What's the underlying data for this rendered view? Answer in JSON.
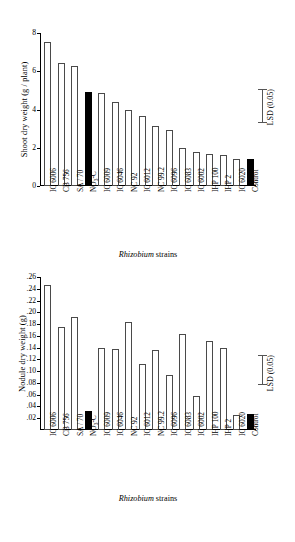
{
  "figure": {
    "xlabel_prefix": "Rhizobium",
    "xlabel_suffix": " strains",
    "categories": [
      "IC 6006",
      "CB 756",
      "SA / 70",
      "NO3-C",
      "IC 6009",
      "IC 6046",
      "NC 92",
      "IC 6012",
      "NC 99.2",
      "IC 6096",
      "IC 6083",
      "IC 6002",
      "IHP 100",
      "IHP 2",
      "IC 6020",
      "Control"
    ],
    "category_labels": [
      {
        "text": "IC 6006",
        "sub": null
      },
      {
        "text": "CB 756",
        "sub": null
      },
      {
        "text": "SA / 70",
        "sub": null
      },
      {
        "text": "NO",
        "sub": "3",
        "tail": "-C"
      },
      {
        "text": "IC 6009",
        "sub": null
      },
      {
        "text": "IC 6046",
        "sub": null
      },
      {
        "text": "NC 92",
        "sub": null
      },
      {
        "text": "IC 6012",
        "sub": null
      },
      {
        "text": "NC 99.2",
        "sub": null
      },
      {
        "text": "IC 6096",
        "sub": null
      },
      {
        "text": "IC 6083",
        "sub": null
      },
      {
        "text": "IC 6002",
        "sub": null
      },
      {
        "text": "IHP 100",
        "sub": null
      },
      {
        "text": "IHP 2",
        "sub": null
      },
      {
        "text": "IC 6020",
        "sub": null
      },
      {
        "text": "Control",
        "sub": null
      }
    ],
    "highlighted_indices": [
      3,
      15
    ],
    "bar_fill_open": "#ffffff",
    "bar_fill_solid": "#000000",
    "bar_stroke": "#4a4a4a"
  },
  "chart_data": [
    {
      "type": "bar",
      "title": "",
      "panel": "top",
      "ylabel": "Shoot dry weight (g / plant)",
      "xlabel": "Rhizobium strains",
      "categories": [
        "IC 6006",
        "CB 756",
        "SA / 70",
        "NO3-C",
        "IC 6009",
        "IC 6046",
        "NC 92",
        "IC 6012",
        "NC 99.2",
        "IC 6096",
        "IC 6083",
        "IC 6002",
        "IHP 100",
        "IHP 2",
        "IC 6020",
        "Control"
      ],
      "values": [
        7.55,
        6.45,
        6.25,
        4.9,
        4.85,
        4.4,
        3.95,
        3.65,
        3.15,
        2.95,
        2.0,
        1.8,
        1.67,
        1.62,
        1.4,
        1.4
      ],
      "ylim": [
        0,
        8
      ],
      "yticks": [
        0,
        2,
        4,
        6,
        8
      ],
      "ytick_labels": [
        "0",
        "2",
        "4",
        "6",
        "8"
      ],
      "grid": false,
      "legend": "none",
      "annotation": {
        "label": "LSD (0.05)",
        "low": 3.3,
        "high": 5.05
      }
    },
    {
      "type": "bar",
      "title": "",
      "panel": "bottom",
      "ylabel": "Nodule dry weight (g)",
      "xlabel": "Rhizobium strains",
      "categories": [
        "IC 6006",
        "CB 756",
        "SA / 70",
        "NO3-C",
        "IC 6009",
        "IC 6046",
        "NC 92",
        "IC 6012",
        "NC 99.2",
        "IC 6096",
        "IC 6083",
        "IC 6002",
        "IHP 100",
        "IHP 2",
        "IC 6020",
        "Control"
      ],
      "values": [
        0.247,
        0.175,
        0.192,
        0.032,
        0.139,
        0.137,
        0.184,
        0.112,
        0.136,
        0.093,
        0.164,
        0.057,
        0.151,
        0.14,
        0.025,
        0.028
      ],
      "ylim": [
        0,
        0.26
      ],
      "yticks": [
        0.02,
        0.04,
        0.06,
        0.08,
        0.1,
        0.12,
        0.14,
        0.16,
        0.18,
        0.2,
        0.22,
        0.24,
        0.26
      ],
      "ytick_labels": [
        ".02",
        ".04",
        ".06",
        ".08",
        ".10",
        ".12",
        ".14",
        ".16",
        ".18",
        ".20",
        ".22",
        ".24",
        ".26"
      ],
      "grid": false,
      "legend": "none",
      "annotation": {
        "label": "LSD (0.05)",
        "low": 0.077,
        "high": 0.128
      }
    }
  ]
}
